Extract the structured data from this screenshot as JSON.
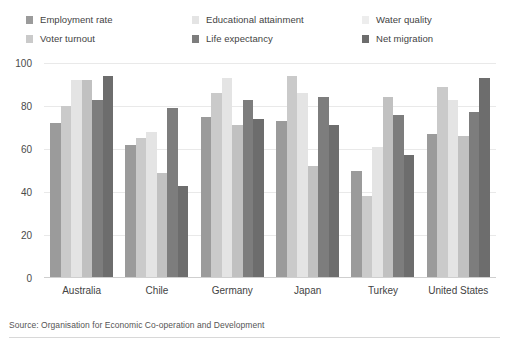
{
  "source_note": "Source: Organisation for Economic Co-operation and Development",
  "legend": {
    "items": [
      {
        "label": "Employment rate",
        "color": "#9b9b9b"
      },
      {
        "label": "Voter turnout",
        "color": "#cacaca"
      },
      {
        "label": "Educational attainment",
        "color": "#e4e4e4"
      },
      {
        "label": "Life expectancy",
        "color": "#7d7d7d"
      },
      {
        "label": "Water quality",
        "color": "#ededed"
      },
      {
        "label": "Net migration",
        "color": "#6d6d6d"
      }
    ]
  },
  "chart_data": {
    "type": "bar",
    "title": "",
    "xlabel": "",
    "ylabel": "",
    "ylim": [
      0,
      100
    ],
    "yticks": [
      0,
      20,
      40,
      60,
      80,
      100
    ],
    "grid": true,
    "legend_position": "top",
    "categories": [
      "Australia",
      "Chile",
      "Germany",
      "Japan",
      "Turkey",
      "United States"
    ],
    "series": [
      {
        "name": "Employment rate",
        "color": "#9b9b9b",
        "values": [
          72,
          62,
          75,
          73,
          50,
          67
        ]
      },
      {
        "name": "Voter turnout",
        "color": "#cacaca",
        "values": [
          80,
          65,
          86,
          94,
          38,
          89
        ]
      },
      {
        "name": "Educational attainment",
        "color": "#e4e4e4",
        "values": [
          92,
          68,
          93,
          86,
          61,
          83
        ]
      },
      {
        "name": "Water quality",
        "color": "#c1c1c1",
        "values": [
          92,
          49,
          71,
          52,
          84,
          66
        ]
      },
      {
        "name": "Life expectancy",
        "color": "#7d7d7d",
        "values": [
          83,
          79,
          83,
          84,
          76,
          77
        ]
      },
      {
        "name": "Net migration",
        "color": "#6d6d6d",
        "values": [
          94,
          43,
          74,
          71,
          57,
          93
        ]
      }
    ]
  }
}
